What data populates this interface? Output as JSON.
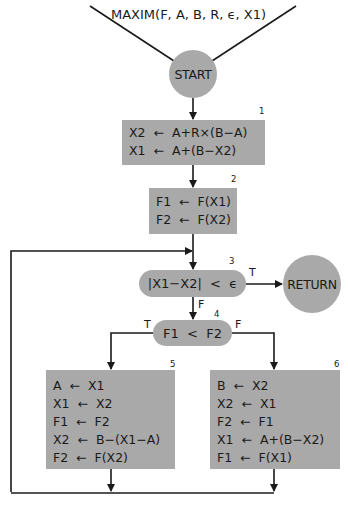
{
  "diagram": {
    "type": "flowchart",
    "title": "MAXIM(F, A, B, R, ϵ, X1)",
    "fill_color": "#a9a9a9",
    "line_color": "#1a1a1a",
    "start": {
      "label": "START"
    },
    "return": {
      "label": "RETURN"
    },
    "box1": {
      "number": "1",
      "lines": [
        "X2  ←  A+R×(B−A)",
        "X1  ←  A+(B−X2)"
      ]
    },
    "box2": {
      "number": "2",
      "lines": [
        "F1  ←  F(X1)",
        "F2  ←  F(X2)"
      ]
    },
    "decision3": {
      "number": "3",
      "label": "|X1−X2|  <  ϵ",
      "true_label": "T",
      "false_label": "F"
    },
    "decision4": {
      "number": "4",
      "label": "F1  <  F2",
      "true_label": "T",
      "false_label": "F"
    },
    "box5": {
      "number": "5",
      "lines": [
        "A  ←  X1",
        "X1  ←  X2",
        "F1  ←  F2",
        "X2  ←  B−(X1−A)",
        "F2  ←  F(X2)"
      ]
    },
    "box6": {
      "number": "6",
      "lines": [
        "B  ←  X2",
        "X2  ←  X1",
        "F2  ←  F1",
        "X1  ←  A+(B−X2)",
        "F1  ←  F(X1)"
      ]
    }
  }
}
